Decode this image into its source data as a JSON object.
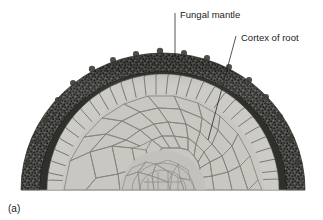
{
  "figure": {
    "caption": "(a)",
    "background_color": "#ffffff"
  },
  "labels": [
    {
      "id": "fungal-mantle",
      "text": "Fungal mantle",
      "text_x": 176,
      "text_y": 19,
      "leader": {
        "x1": 175,
        "y1": 13,
        "x2": 175,
        "y2": 58
      }
    },
    {
      "id": "cortex-of-root",
      "text": "Cortex of root",
      "text_x": 238,
      "text_y": 42,
      "leader": {
        "x1": 236,
        "y1": 36,
        "x2": 208,
        "y2": 140
      }
    }
  ],
  "structures": {
    "fungal_mantle": {
      "name": "Fungal mantle",
      "color": "#4a4a48",
      "texture": "granular-dense",
      "band_thickness_px": 17
    },
    "palisade_cortex": {
      "name": "Radial palisade cortex cells",
      "cell_fill": "#c9c9c4",
      "cell_outline": "#3a3a38",
      "count": 30
    },
    "hartig_net": {
      "name": "Hartig net",
      "color": "#35352f"
    },
    "inner_cortex": {
      "name": "Cortex of root",
      "cell_fill": "#c6c6c1",
      "cell_outline": "#7a7a74"
    },
    "stele": {
      "name": "Central stele",
      "cell_fill": "#bfbfba",
      "cell_outline": "#8a8a84"
    },
    "cut_edge": {
      "name": "Flat cut base",
      "y": 190
    }
  },
  "geometry": {
    "center_x": 163,
    "base_y": 190,
    "outer_radius_x": 142,
    "outer_radius_y": 137
  }
}
